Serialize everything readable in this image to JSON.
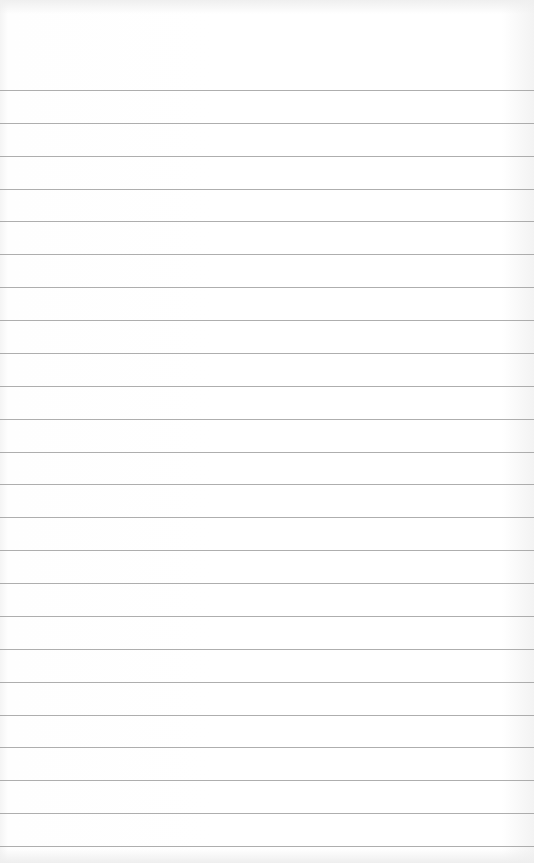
{
  "page": {
    "type": "lined-paper",
    "background_color": "#ffffff",
    "rule_color": "#9a9a9a",
    "rule_count": 24,
    "first_rule_y": 90,
    "rule_spacing": 32.87,
    "text": ""
  }
}
